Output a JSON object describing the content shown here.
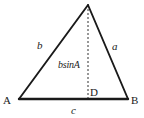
{
  "figure": {
    "type": "geometry-diagram",
    "background_color": "#ffffff",
    "stroke_color": "#1a1a1a",
    "labels": {
      "vertex_a": "A",
      "vertex_b": "B",
      "foot_d": "D",
      "side_b": "b",
      "side_a": "a",
      "side_c": "c",
      "altitude": "bsinA"
    },
    "geometry": {
      "apex": {
        "x": 88,
        "y": 5
      },
      "vertex_a": {
        "x": 19,
        "y": 99
      },
      "vertex_b": {
        "x": 128,
        "y": 99
      },
      "foot_d": {
        "x": 88,
        "y": 99
      },
      "base_stroke_width": 2.4,
      "leg_stroke_width": 1.9,
      "altitude_stroke_width": 0.9,
      "altitude_dash": "2,2"
    }
  }
}
